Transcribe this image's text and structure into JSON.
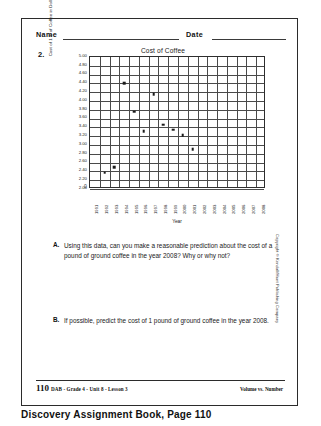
{
  "header": {
    "name_label": "Name",
    "date_label": "Date"
  },
  "problem": {
    "number": "2."
  },
  "chart_data": {
    "type": "scatter",
    "title": "Cost of Coffee",
    "xlabel": "Year",
    "ylabel": "Cost of 1 lb of Coffee in Dollars",
    "ylim": [
      2.0,
      5.0
    ],
    "ystep": 0.2,
    "ytick_labels": [
      "5.00",
      "4.80",
      "4.60",
      "4.40",
      "4.20",
      "4.00",
      "3.80",
      "3.60",
      "3.40",
      "3.20",
      "3.00",
      "2.80",
      "2.60",
      "2.40",
      "2.20",
      "2.00"
    ],
    "categories": [
      "1991",
      "1992",
      "1993",
      "1994",
      "1995",
      "1996",
      "1997",
      "1998",
      "1999",
      "2000",
      "2001",
      "2002",
      "2003",
      "2004",
      "2005",
      "2006",
      "2007",
      "2008"
    ],
    "grid": true,
    "legend": "none",
    "axis_break_symbol": "0",
    "points": [
      {
        "x": "1992",
        "y": 2.37
      },
      {
        "x": "1993",
        "y": 2.5
      },
      {
        "x": "1994",
        "y": 4.4
      },
      {
        "x": "1995",
        "y": 3.76
      },
      {
        "x": "1996",
        "y": 3.31
      },
      {
        "x": "1997",
        "y": 4.16
      },
      {
        "x": "1998",
        "y": 3.46
      },
      {
        "x": "1999",
        "y": 3.35
      },
      {
        "x": "2000",
        "y": 3.22
      },
      {
        "x": "2001",
        "y": 2.91
      }
    ]
  },
  "questions": {
    "a": {
      "letter": "A.",
      "text": "Using this data, can you make a reasonable prediction about the cost of a pound of ground coffee in the year 2008? Why or why not?"
    },
    "b": {
      "letter": "B.",
      "text": "If possible, predict the cost of 1 pound of ground coffee in the year 2008."
    }
  },
  "copyright": "Copyright © Kendall/Hunt Publishing Company",
  "footer": {
    "page_number": "110",
    "source": "DAB - Grade 4 - Unit 8 - Lesson 3",
    "section": "Volume vs. Number"
  },
  "caption": "Discovery Assignment Book, Page 110"
}
